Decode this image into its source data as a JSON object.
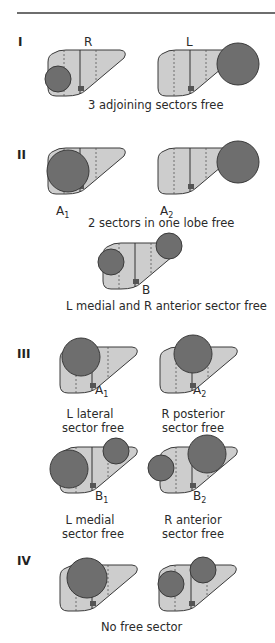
{
  "figure": {
    "colors": {
      "liver_fill": "#cdcdcd",
      "liver_stroke": "#3a3a3a",
      "tumor_fill": "#6e6e6e",
      "tumor_stroke": "#3a3a3a",
      "hilum_fill": "#555555",
      "rule": "#6e6e6e"
    },
    "groups": [
      {
        "roman": "I",
        "caption": "3 adjoining sectors free",
        "diagrams": [
          {
            "id": "I-R",
            "label": "R",
            "x": 46,
            "y": 50,
            "circles": [
              {
                "cx": 12,
                "cy": 29,
                "r": 13
              }
            ]
          },
          {
            "id": "I-L",
            "label": "L",
            "x": 156,
            "y": 50,
            "circles": [
              {
                "cx": 82,
                "cy": 14,
                "r": 21
              }
            ]
          }
        ]
      },
      {
        "roman": "II",
        "caption": "2 sectors in one lobe free",
        "diagrams": [
          {
            "id": "II-A1",
            "label_main": "A",
            "label_sub": "1",
            "x": 46,
            "y": 148,
            "circles": [
              {
                "cx": 22,
                "cy": 23,
                "r": 21
              }
            ]
          },
          {
            "id": "II-A2",
            "label_main": "A",
            "label_sub": "2",
            "x": 156,
            "y": 148,
            "circles": [
              {
                "cx": 82,
                "cy": 14,
                "r": 21
              }
            ]
          }
        ]
      },
      {
        "caption": "L medial and R anterior sector free",
        "diagrams": [
          {
            "id": "II-B",
            "label": "B",
            "x": 101,
            "y": 243,
            "circles": [
              {
                "cx": 10,
                "cy": 19,
                "r": 13
              },
              {
                "cx": 68,
                "cy": 3,
                "r": 13
              }
            ]
          }
        ]
      },
      {
        "roman": "III",
        "captions": [
          {
            "line1": "L lateral",
            "line2": "sector free"
          },
          {
            "line1": "R posterior",
            "line2": "sector free"
          },
          {
            "line1": "L medial",
            "line2": "sector free"
          },
          {
            "line1": "R anterior",
            "line2": "sector free"
          }
        ],
        "diagrams": [
          {
            "id": "III-A1",
            "label_main": "A",
            "label_sub": "1",
            "x": 58,
            "y": 347,
            "circles": [
              {
                "cx": 23,
                "cy": 10,
                "r": 19
              }
            ]
          },
          {
            "id": "III-A2",
            "label_main": "A",
            "label_sub": "2",
            "x": 158,
            "y": 347,
            "circles": [
              {
                "cx": 35,
                "cy": 7,
                "r": 19
              }
            ]
          },
          {
            "id": "III-B1",
            "label_main": "B",
            "label_sub": "1",
            "x": 58,
            "y": 447,
            "circles": [
              {
                "cx": 11,
                "cy": 22,
                "r": 19
              },
              {
                "cx": 58,
                "cy": 4,
                "r": 13
              }
            ]
          },
          {
            "id": "III-B2",
            "label_main": "B",
            "label_sub": "2",
            "x": 158,
            "y": 447,
            "circles": [
              {
                "cx": 3,
                "cy": 21,
                "r": 13
              },
              {
                "cx": 49,
                "cy": 7,
                "r": 19
              }
            ]
          }
        ]
      },
      {
        "roman": "IV",
        "caption": "No free sector",
        "diagrams": [
          {
            "id": "IV-1",
            "x": 58,
            "y": 565,
            "circles": [
              {
                "cx": 29,
                "cy": 13,
                "r": 20
              }
            ]
          },
          {
            "id": "IV-2",
            "x": 157,
            "y": 565,
            "circles": [
              {
                "cx": 14,
                "cy": 19,
                "r": 13
              },
              {
                "cx": 46,
                "cy": 5,
                "r": 13
              }
            ]
          }
        ]
      }
    ]
  }
}
